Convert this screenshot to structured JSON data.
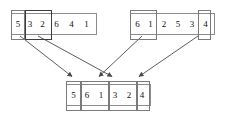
{
  "diagram": {
    "type": "array-merge-diagram",
    "colors": {
      "box_border": "#8c8c8c",
      "segment_border": "#7a7a7a",
      "segment_border_dark": "#3d3d3d",
      "arrow": "#4a4a4a",
      "text": "#111111",
      "background": "#ffffff"
    },
    "arrays": [
      {
        "id": "source-left",
        "role": "source",
        "values": [
          "5",
          "3",
          "2",
          "6",
          "4",
          "1"
        ],
        "segments": [
          {
            "id": "left-seg-1",
            "label": "5",
            "values": [
              "5"
            ],
            "emphasis": "normal"
          },
          {
            "id": "left-seg-2",
            "label": "3 2",
            "values": [
              "3",
              "2"
            ],
            "emphasis": "dark"
          }
        ],
        "tail_values": [
          "6",
          "4",
          "1"
        ]
      },
      {
        "id": "source-right",
        "role": "source",
        "values": [
          "6",
          "1",
          "2",
          "5",
          "3",
          "4"
        ],
        "segments": [
          {
            "id": "right-seg-1",
            "label": "6 1",
            "values": [
              "6",
              "1"
            ],
            "emphasis": "normal"
          },
          {
            "id": "right-seg-2",
            "label": "4",
            "values": [
              "4"
            ],
            "emphasis": "normal"
          }
        ],
        "middle_values": [
          "2",
          "5",
          "3"
        ]
      },
      {
        "id": "destination",
        "role": "destination",
        "values": [
          "5",
          "6",
          "1",
          "3",
          "2",
          "4"
        ],
        "segments": [
          {
            "id": "dest-seg-1",
            "label": "5",
            "values": [
              "5"
            ],
            "emphasis": "normal"
          },
          {
            "id": "dest-seg-2",
            "label": "6 1",
            "values": [
              "6",
              "1"
            ],
            "emphasis": "normal"
          },
          {
            "id": "dest-seg-3",
            "label": "3 2",
            "values": [
              "3",
              "2"
            ],
            "emphasis": "normal"
          },
          {
            "id": "dest-seg-4",
            "label": "4",
            "values": [
              "4"
            ],
            "emphasis": "normal"
          }
        ]
      }
    ],
    "arrows": [
      {
        "id": "arrow-1",
        "from": "left-seg-1",
        "to": "dest-seg-1"
      },
      {
        "id": "arrow-2",
        "from": "left-seg-2",
        "to": "dest-seg-3"
      },
      {
        "id": "arrow-3",
        "from": "right-seg-1",
        "to": "dest-seg-2"
      },
      {
        "id": "arrow-4",
        "from": "right-seg-2",
        "to": "dest-seg-4"
      }
    ]
  }
}
